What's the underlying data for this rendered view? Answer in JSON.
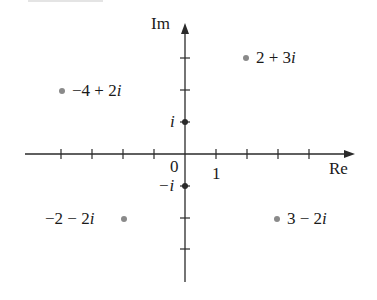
{
  "diagram": {
    "axes": {
      "x_label": "Re",
      "y_label": "Im",
      "origin_label": "0",
      "x_unit_label": "1",
      "i_label": "i",
      "neg_i_label": "−i",
      "x_ticks": [
        -4,
        -3,
        -2,
        -1,
        1,
        2,
        3,
        4
      ],
      "y_ticks": [
        -3,
        -2,
        -1,
        1,
        2,
        3
      ]
    },
    "points": [
      {
        "re": 2,
        "im": 3,
        "label": "2 + 3i",
        "label_re": "2 + 3",
        "label_side": "right"
      },
      {
        "re": -4,
        "im": 2,
        "label": "−4 + 2i",
        "label_re": "−4 + 2",
        "label_side": "right"
      },
      {
        "re": -2,
        "im": -2,
        "label": "−2 − 2i",
        "label_re": "−2 − 2",
        "label_side": "left"
      },
      {
        "re": 3,
        "im": -2,
        "label": "3 − 2i",
        "label_re": "3 − 2",
        "label_side": "right"
      }
    ],
    "colors": {
      "axis": "#2a2a2a",
      "point": "#8a8a8a",
      "axis_point": "#2a2a2a"
    }
  }
}
